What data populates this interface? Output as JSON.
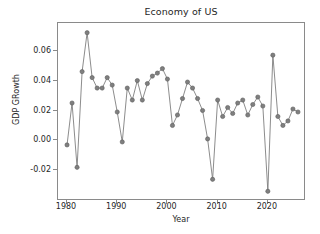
{
  "chart_data": {
    "type": "line",
    "title": "Economy of US",
    "xlabel": "Year",
    "ylabel": "GDP GRowth",
    "xlim": [
      1978.2,
      2027.6
    ],
    "ylim": [
      -0.0405,
      0.0785
    ],
    "grid": false,
    "legend": null,
    "xticks": [
      1980,
      1990,
      2000,
      2010,
      2020
    ],
    "xticklabels": [
      "1980",
      "1990",
      "2000",
      "2010",
      "2020"
    ],
    "yticks": [
      -0.02,
      0.0,
      0.02,
      0.04,
      0.06
    ],
    "yticklabels": [
      "-0.02",
      "0.00",
      "0.02",
      "0.04",
      "0.06"
    ],
    "marker": "o",
    "line_color": "#7f7f7f",
    "marker_color": "#7f7f7f",
    "marker_edge_color": "#5a5a5a",
    "x": [
      1980,
      1981,
      1982,
      1983,
      1984,
      1985,
      1986,
      1987,
      1988,
      1989,
      1990,
      1991,
      1992,
      1993,
      1994,
      1995,
      1996,
      1997,
      1998,
      1999,
      2000,
      2001,
      2002,
      2003,
      2004,
      2005,
      2006,
      2007,
      2008,
      2009,
      2010,
      2011,
      2012,
      2013,
      2014,
      2015,
      2016,
      2017,
      2018,
      2019,
      2020,
      2021,
      2022,
      2023,
      2024,
      2025,
      2026
    ],
    "y": [
      -0.003,
      0.025,
      -0.018,
      0.046,
      0.072,
      0.042,
      0.035,
      0.035,
      0.042,
      0.037,
      0.019,
      -0.001,
      0.035,
      0.027,
      0.04,
      0.027,
      0.038,
      0.043,
      0.045,
      0.048,
      0.041,
      0.01,
      0.017,
      0.028,
      0.039,
      0.035,
      0.028,
      0.02,
      0.001,
      -0.026,
      0.027,
      0.016,
      0.022,
      0.018,
      0.025,
      0.027,
      0.017,
      0.024,
      0.029,
      0.023,
      -0.034,
      0.057,
      0.016,
      0.01,
      0.013,
      0.021,
      0.019
    ]
  }
}
